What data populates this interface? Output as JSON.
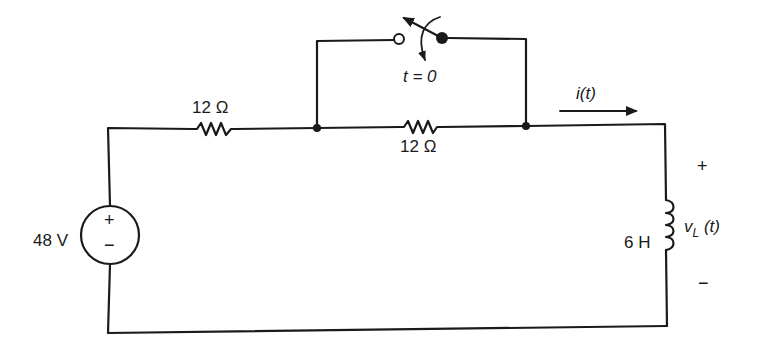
{
  "diagram": {
    "type": "electrical-circuit",
    "components": {
      "source": {
        "kind": "dc-voltage-source",
        "label": "48 V",
        "plus": "+",
        "minus": "−"
      },
      "resistor_series": {
        "kind": "resistor",
        "label": "12 Ω"
      },
      "resistor_bypassed": {
        "kind": "resistor",
        "label": "12 Ω"
      },
      "switch": {
        "kind": "switch",
        "label": "t = 0",
        "action": "closes at t = 0 (bypasses parallel resistor)"
      },
      "inductor": {
        "kind": "inductor",
        "label": "6 H"
      }
    },
    "annotations": {
      "current": {
        "label": "i(t)",
        "direction": "right"
      },
      "inductor_voltage": {
        "label": "v",
        "subscript": "L",
        "suffix": " (t)",
        "plus": "+",
        "minus": "−"
      }
    },
    "colors": {
      "ink": "#1a1a1a",
      "background": "#ffffff"
    }
  }
}
